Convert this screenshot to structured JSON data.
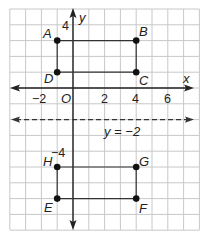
{
  "diagram": {
    "type": "coordinate-plane",
    "grid": {
      "x_min": -4,
      "x_max": 8,
      "y_min": -9,
      "y_max": 5,
      "unit_px": 15.8,
      "origin_px": [
        73,
        88
      ]
    },
    "colors": {
      "grid": "#c8c8c8",
      "axis": "#222222",
      "line": "#333333",
      "point": "#111111"
    },
    "axes": {
      "x_label": "x",
      "y_label": "y",
      "origin_label": "O",
      "x_ticks": [
        {
          "value": -2,
          "label": "−2"
        },
        {
          "value": 2,
          "label": "2"
        },
        {
          "value": 4,
          "label": "4"
        },
        {
          "value": 6,
          "label": "6"
        }
      ],
      "y_ticks": [
        {
          "value": 4,
          "label": "4"
        },
        {
          "value": -4,
          "label": "−4"
        }
      ]
    },
    "reflection_line": {
      "equation_label": "y = −2",
      "y": -2,
      "style": "dashed"
    },
    "rectangles": [
      {
        "name": "ABCD",
        "points": [
          {
            "label": "A",
            "x": -1,
            "y": 3
          },
          {
            "label": "B",
            "x": 4,
            "y": 3
          },
          {
            "label": "C",
            "x": 4,
            "y": 1
          },
          {
            "label": "D",
            "x": -1,
            "y": 1
          }
        ]
      },
      {
        "name": "EFGH",
        "points": [
          {
            "label": "H",
            "x": -1,
            "y": -5
          },
          {
            "label": "G",
            "x": 4,
            "y": -5
          },
          {
            "label": "F",
            "x": 4,
            "y": -7
          },
          {
            "label": "E",
            "x": -1,
            "y": -7
          }
        ]
      }
    ]
  }
}
